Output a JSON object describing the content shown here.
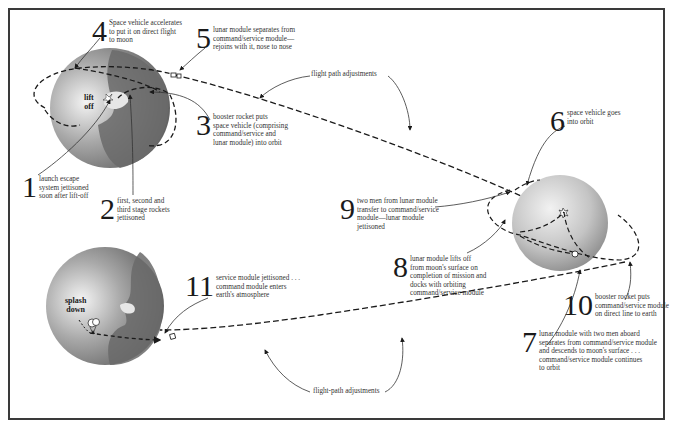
{
  "diagram": {
    "type": "apollo-mission-flight-diagram",
    "colors": {
      "frame": "#3a3a3a",
      "earth_ocean": "#6e6e6e",
      "earth_land": "#d8d8d8",
      "moon": "#c8c8c8",
      "path": "#1a1a1a",
      "text": "#333333"
    },
    "bodies": {
      "earth_launch": {
        "label": "lift\noff"
      },
      "earth_return": {
        "label": "splash\ndown"
      },
      "moon": {
        "label": ""
      }
    },
    "steps": [
      {
        "number": "1",
        "text": "launch escape\nsystem jettisoned\nsoon after lift-off"
      },
      {
        "number": "2",
        "text": "first, second and\nthird stage rockets\njettisoned"
      },
      {
        "number": "3",
        "text": "booster rocket puts\nspace vehicle (comprising\ncommand/service and\nlunar module) into orbit"
      },
      {
        "number": "4",
        "text": "Space vehicle accelerates\nto put it on direct flight\nto moon"
      },
      {
        "number": "5",
        "text": "lunar module separates from\ncommand/service module—\nrejoins with it, nose to nose"
      },
      {
        "number": "6",
        "text": "space vehicle goes\ninto orbit"
      },
      {
        "number": "7",
        "text": "lunar module with two men aboard\nseparates from command/service module\nand descends to moon's surface . . .\ncommand/service module continues\nto orbit"
      },
      {
        "number": "8",
        "text": "lunar module lifts off\nfrom moon's surface on\ncompletion of mission and\ndocks with orbiting\ncommand/service module"
      },
      {
        "number": "9",
        "text": "two men from lunar module\ntransfer to command/service\nmodule—lunar module\njettisoned"
      },
      {
        "number": "10",
        "text": "booster rocket puts\ncommand/service module\non direct line to earth"
      },
      {
        "number": "11",
        "text": "service module jettisoned . . .\ncommand module enters\nearth's atmosphere"
      }
    ],
    "notes": {
      "outbound_adjustments": "flight path adjustments",
      "return_adjustments": "flight-path adjustments"
    }
  }
}
